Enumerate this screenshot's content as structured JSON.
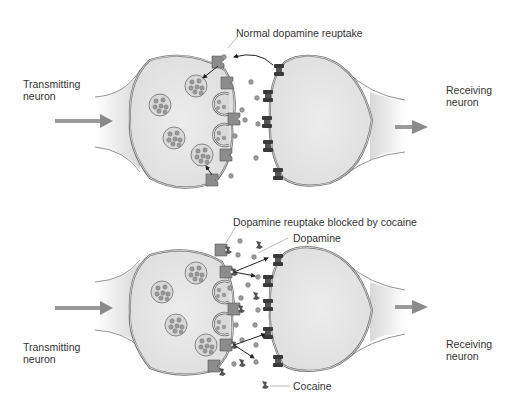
{
  "diagram": {
    "panels": [
      {
        "id": "normal",
        "transmitting_label": [
          "Transmitting",
          "neuron"
        ],
        "receiving_label": [
          "Receiving",
          "neuron"
        ],
        "annotation": "Normal dopamine reuptake"
      },
      {
        "id": "cocaine",
        "transmitting_label": [
          "Transmitting",
          "neuron"
        ],
        "receiving_label": [
          "Receiving",
          "neuron"
        ],
        "annotation": "Dopamine reuptake blocked by cocaine",
        "legend_dopamine": "Dopamine",
        "legend_cocaine": "Cocaine"
      }
    ],
    "colors": {
      "cell_fill": "#e6e6e6",
      "membrane": "#6e6e6e",
      "dopamine": "#9a9a9a",
      "transporter": "#8c8c8c",
      "receptor": "#3a3a3a",
      "arrow": "#8a8a8a",
      "text": "#333333"
    }
  }
}
